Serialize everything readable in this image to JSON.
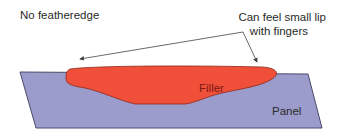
{
  "diagram": {
    "labels": {
      "no_featheredge": "No featheredge",
      "lip_line1": "Can feel small lip",
      "lip_line2": "with fingers",
      "filler": "Filler",
      "panel": "Panel"
    },
    "colors": {
      "panel_fill": "#9c9ccc",
      "panel_stroke": "#4a4a6a",
      "filler_fill": "#f0503a",
      "filler_stroke": "#8a2a1a",
      "arrow": "#444444",
      "text": "#2a2a2a"
    }
  }
}
